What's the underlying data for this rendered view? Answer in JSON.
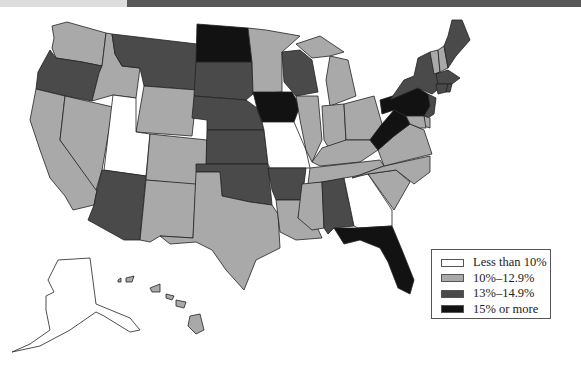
{
  "colors": {
    "less_than_10": "#ffffff",
    "10_to_12_9": "#a9a9a9",
    "13_to_14_9": "#4a4a4a",
    "15_or_more": "#121212",
    "topbar_left": "#dddddd",
    "topbar_right": "#585858"
  },
  "legend": {
    "items": [
      {
        "label": "Less than 10%",
        "category": "less_than_10",
        "color": "#ffffff"
      },
      {
        "label": "10%–12.9%",
        "category": "10_to_12_9",
        "color": "#a9a9a9"
      },
      {
        "label": "13%–14.9%",
        "category": "13_to_14_9",
        "color": "#4a4a4a"
      },
      {
        "label": "15% or more",
        "category": "15_or_more",
        "color": "#121212"
      }
    ]
  },
  "states": {
    "WA": "10_to_12_9",
    "OR": "13_to_14_9",
    "CA": "10_to_12_9",
    "NV": "10_to_12_9",
    "ID": "10_to_12_9",
    "MT": "13_to_14_9",
    "WY": "10_to_12_9",
    "UT": "less_than_10",
    "AZ": "13_to_14_9",
    "CO": "10_to_12_9",
    "NM": "10_to_12_9",
    "ND": "15_or_more",
    "SD": "13_to_14_9",
    "NE": "13_to_14_9",
    "KS": "13_to_14_9",
    "OK": "13_to_14_9",
    "TX": "10_to_12_9",
    "MN": "10_to_12_9",
    "IA": "15_or_more",
    "MO": "less_than_10",
    "AR": "13_to_14_9",
    "LA": "10_to_12_9",
    "WI": "13_to_14_9",
    "IL": "10_to_12_9",
    "MI": "10_to_12_9",
    "IN": "10_to_12_9",
    "OH": "10_to_12_9",
    "KY": "10_to_12_9",
    "TN": "10_to_12_9",
    "MS": "10_to_12_9",
    "AL": "13_to_14_9",
    "GA": "less_than_10",
    "FL": "15_or_more",
    "SC": "10_to_12_9",
    "NC": "10_to_12_9",
    "VA": "10_to_12_9",
    "WV": "15_or_more",
    "PA": "15_or_more",
    "NY": "13_to_14_9",
    "VT": "10_to_12_9",
    "NH": "10_to_12_9",
    "ME": "13_to_14_9",
    "MA": "13_to_14_9",
    "RI": "13_to_14_9",
    "CT": "13_to_14_9",
    "NJ": "13_to_14_9",
    "DE": "10_to_12_9",
    "MD": "10_to_12_9",
    "AK": "less_than_10",
    "HI": "10_to_12_9"
  }
}
